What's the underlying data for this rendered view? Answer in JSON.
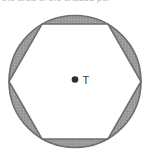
{
  "figure": {
    "cut_off_caption": "the area of the shaded por",
    "center_point": {
      "label": "T",
      "marker": "filled-dot"
    },
    "shapes": {
      "circle": {
        "name": "circle",
        "center_x": 75,
        "center_y": 81.5,
        "radius": 66,
        "stroke": "#6e6e6e",
        "fill": "#ffffff"
      },
      "hexagon": {
        "name": "regular-hexagon",
        "orientation": "flat-top",
        "vertex_count": 6,
        "stroke": "#6e6e6e",
        "fill": "#ffffff",
        "vertices": [
          [
            42,
            24
          ],
          [
            108,
            24
          ],
          [
            141,
            81.5
          ],
          [
            108,
            139
          ],
          [
            42,
            139
          ],
          [
            9,
            81.5
          ]
        ]
      },
      "shaded_segments": {
        "name": "circular-segments",
        "count": 6,
        "fill": "#9d9d9d",
        "description": "six congruent circular segments between the circle and the hexagon sides"
      }
    },
    "colors": {
      "outline": "#6e6e6e",
      "shading": "#9d9d9d",
      "background": "#ffffff",
      "label_text": "#3b3b3b",
      "cut_text": "#b9b9b9"
    }
  }
}
